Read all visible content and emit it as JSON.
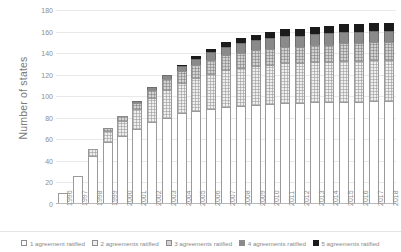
{
  "chart_data": {
    "type": "bar",
    "stacked": true,
    "title": "",
    "xlabel": "",
    "ylabel": "Number of states",
    "ylim": [
      0,
      180
    ],
    "ytick_step": 20,
    "yticks": [
      180,
      160,
      140,
      120,
      100,
      80,
      60,
      40,
      20,
      0
    ],
    "grid": true,
    "legend_position": "bottom",
    "categories": [
      "1996",
      "1997",
      "1998",
      "1999",
      "2000",
      "2001",
      "2002",
      "2003",
      "2004",
      "2005",
      "2006",
      "2007",
      "2008",
      "2009",
      "2010",
      "2011",
      "2012",
      "2013",
      "2014",
      "2015",
      "2016",
      "2017",
      "2018"
    ],
    "series": [
      {
        "name": "1 agreement ratified",
        "color": "#ffffff",
        "values": [
          10,
          26,
          45,
          58,
          63,
          70,
          76,
          80,
          84,
          86,
          88,
          90,
          91,
          92,
          93,
          94,
          94,
          95,
          95,
          95,
          95,
          96,
          96
        ]
      },
      {
        "name": "2 agreements ratified",
        "color": "#efefef",
        "values": [
          0,
          0,
          6,
          10,
          14,
          18,
          22,
          26,
          28,
          31,
          33,
          34,
          35,
          36,
          36,
          37,
          37,
          37,
          37,
          38,
          38,
          38,
          38
        ]
      },
      {
        "name": "3 agreements ratified",
        "color": "#d2d2d2",
        "values": [
          0,
          0,
          0,
          3,
          5,
          6,
          8,
          10,
          11,
          12,
          13,
          14,
          14,
          15,
          15,
          15,
          15,
          16,
          16,
          16,
          16,
          16,
          16
        ]
      },
      {
        "name": "4 agreements ratified",
        "color": "#8a8a8a",
        "values": [
          0,
          0,
          0,
          0,
          0,
          2,
          3,
          4,
          5,
          6,
          7,
          8,
          9,
          9,
          10,
          10,
          10,
          10,
          11,
          11,
          11,
          11,
          11
        ]
      },
      {
        "name": "5 agreements ratified",
        "color": "#1b1b1b",
        "values": [
          0,
          0,
          0,
          0,
          0,
          0,
          0,
          0,
          1,
          2,
          3,
          4,
          5,
          5,
          6,
          6,
          6,
          6,
          6,
          7,
          7,
          7,
          7
        ]
      }
    ],
    "totals": [
      10,
      26,
      51,
      71,
      82,
      96,
      109,
      120,
      129,
      137,
      144,
      150,
      154,
      157,
      160,
      162,
      162,
      164,
      165,
      167,
      167,
      168,
      168
    ]
  }
}
